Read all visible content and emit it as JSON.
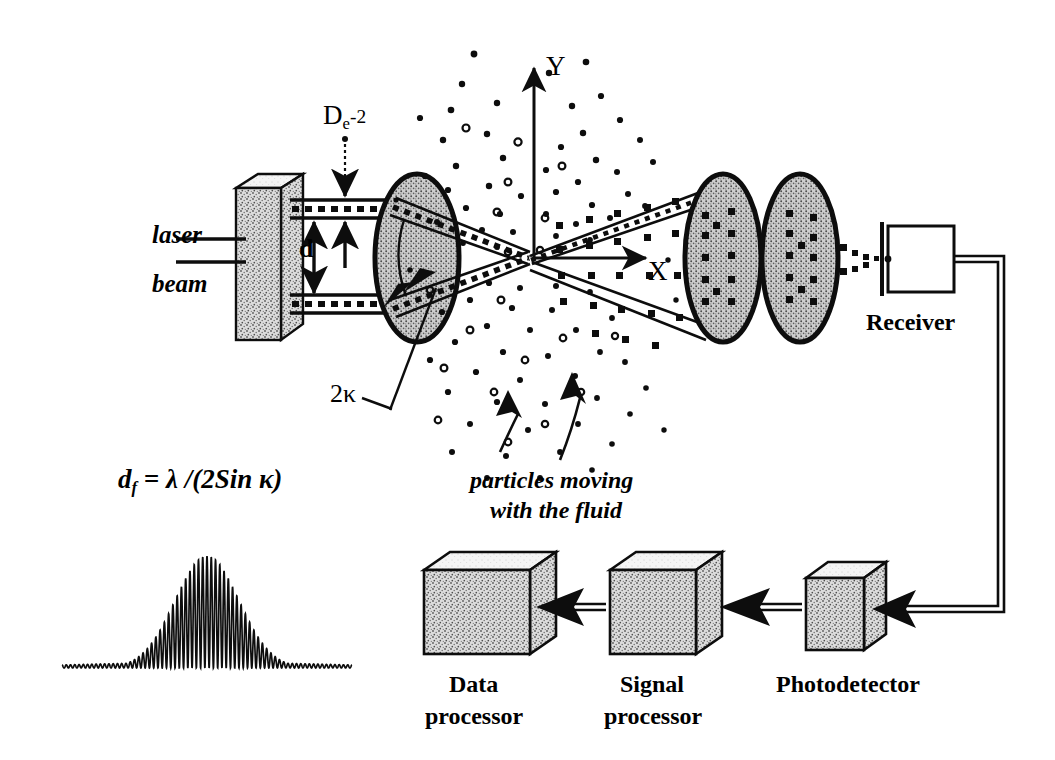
{
  "diagram": {
    "colors": {
      "ink": "#0d0d0d",
      "lens_fill": "#c9c9c9",
      "box_fill": "#bdbdbd",
      "box_top": "#f2f2f2",
      "paper": "#ffffff"
    },
    "labels": {
      "laser": "laser",
      "beam": "beam",
      "beam_diameter": {
        "base": "D",
        "subscript": "e",
        "exponent": "-2"
      },
      "beam_separation": "d",
      "beam_angle": "2κ",
      "axis_y": "Y",
      "axis_x": "X",
      "particles": {
        "line1": "particles moving",
        "line2": "with the fluid"
      },
      "receiver": "Receiver",
      "fringe_formula": {
        "lhs_base": "d",
        "lhs_sub": "f",
        "rhs": "= λ /(2Sin κ)"
      }
    },
    "blocks": [
      {
        "name": "data-processor",
        "line1": "Data",
        "line2": "processor"
      },
      {
        "name": "signal-processor",
        "line1": "Signal",
        "line2": "processor"
      },
      {
        "name": "photodetector",
        "line1": "Photodetector",
        "line2": ""
      }
    ],
    "optics": {
      "source_box": "laser beam splitter",
      "transmitting_lens": "transmitting lens",
      "receiving_lens_1": "receiving lens 1",
      "receiving_lens_2": "receiving lens 2",
      "crossing_point": "measurement volume"
    },
    "signal": {
      "name": "doppler-burst-waveform",
      "description": "Gaussian-enveloped Doppler burst signal",
      "envelope_peak": 1.0,
      "carrier_cycles": 34,
      "pedestal": 0.05
    }
  }
}
